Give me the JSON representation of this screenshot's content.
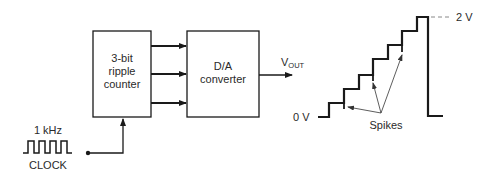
{
  "counter": {
    "line1": "3-bit",
    "line2": "ripple",
    "line3": "counter"
  },
  "dac": {
    "line1": "D/A",
    "line2": "converter"
  },
  "output": {
    "v": "V",
    "sub": "OUT"
  },
  "clock": {
    "freq": "1 kHz",
    "label": "CLOCK"
  },
  "waveform": {
    "low_label": "0 V",
    "high_label": "2 V",
    "spikes_label": "Spikes",
    "steps": 8
  },
  "colors": {
    "line": "#1a1a1a",
    "text": "#2a2a2a",
    "dash": "#888888"
  }
}
